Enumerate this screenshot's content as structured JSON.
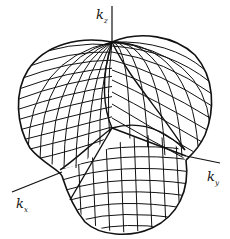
{
  "figure": {
    "type": "3d-wireframe-surface",
    "colors": {
      "line": "#111111",
      "background": "#ffffff"
    },
    "axes": {
      "kz": {
        "symbol": "k",
        "subscript": "z"
      },
      "kx": {
        "symbol": "k",
        "subscript": "x"
      },
      "ky": {
        "symbol": "k",
        "subscript": "y"
      }
    }
  }
}
